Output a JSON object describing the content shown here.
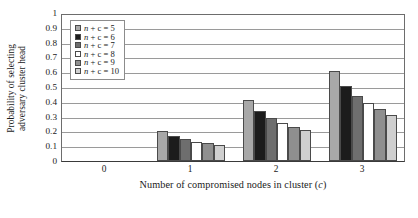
{
  "chart_data": {
    "type": "bar",
    "title": "",
    "subtitle": "",
    "xlabel": "Number of compromised nodes in cluster (c)",
    "ylabel": "Probability of selecting adversary cluster head",
    "ylabel_lines": [
      "Probability of selecting",
      "adversary cluster head"
    ],
    "categories": [
      "0",
      "1",
      "2",
      "3"
    ],
    "ylim": [
      0,
      1
    ],
    "ytick_labels": [
      "0",
      "0.1",
      "0.2",
      "0.3",
      "0.4",
      "0.5",
      "0.6",
      "0.7",
      "0.8",
      "0.9",
      "1"
    ],
    "ytick_values": [
      0,
      0.1,
      0.2,
      0.3,
      0.4,
      0.5,
      0.6,
      0.7,
      0.8,
      0.9,
      1
    ],
    "grid": true,
    "grid_axis": "y",
    "legend_position": "upper left inside",
    "series": [
      {
        "name": "n + c = 5",
        "color": "#a8a8a8",
        "values": [
          0,
          0.2,
          0.41,
          0.61
        ]
      },
      {
        "name": "n + c = 6",
        "color": "#1c1c1c",
        "values": [
          0,
          0.17,
          0.34,
          0.51
        ]
      },
      {
        "name": "n + c = 7",
        "color": "#6e6e6e",
        "values": [
          0,
          0.15,
          0.29,
          0.44
        ]
      },
      {
        "name": "n + c = 8",
        "color": "#ffffff",
        "values": [
          0,
          0.13,
          0.26,
          0.39
        ]
      },
      {
        "name": "n + c = 9",
        "color": "#8f8f8f",
        "values": [
          0,
          0.12,
          0.23,
          0.35
        ]
      },
      {
        "name": "n + c = 10",
        "color": "#cfcfcf",
        "values": [
          0,
          0.11,
          0.21,
          0.31
        ]
      }
    ]
  },
  "legend": {
    "entries": [
      {
        "prefix": "n",
        "rest": " + c = 5"
      },
      {
        "prefix": "n",
        "rest": " + c = 6"
      },
      {
        "prefix": "n",
        "rest": " + c = 7"
      },
      {
        "prefix": "n",
        "rest": " + c = 8"
      },
      {
        "prefix": "n",
        "rest": " + c = 9"
      },
      {
        "prefix": "n",
        "rest": " + c = 10"
      }
    ]
  },
  "axes": {
    "x_title_main": "Number of compromised nodes in cluster (",
    "x_title_italic": "c",
    "x_title_tail": ")"
  }
}
